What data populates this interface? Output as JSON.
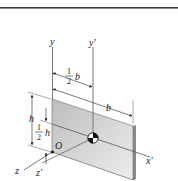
{
  "figure": {
    "colors": {
      "rule": "#3a3a3a",
      "plate_face": "#c9c9c9",
      "plate_face_light": "#e6e6e6",
      "plate_edge": "#8a8a8a",
      "axis": "#555555",
      "text": "#222222"
    },
    "axes": {
      "y": "y",
      "y_prime": "y′",
      "x_prime": "x′",
      "z": "z",
      "z_prime": "z′"
    },
    "origin_label": "O",
    "dimensions": {
      "half_b": {
        "num": "1",
        "den": "2",
        "var": "b"
      },
      "b": "b",
      "h": "h",
      "half_h": {
        "num": "1",
        "den": "2",
        "var": "h"
      }
    }
  }
}
